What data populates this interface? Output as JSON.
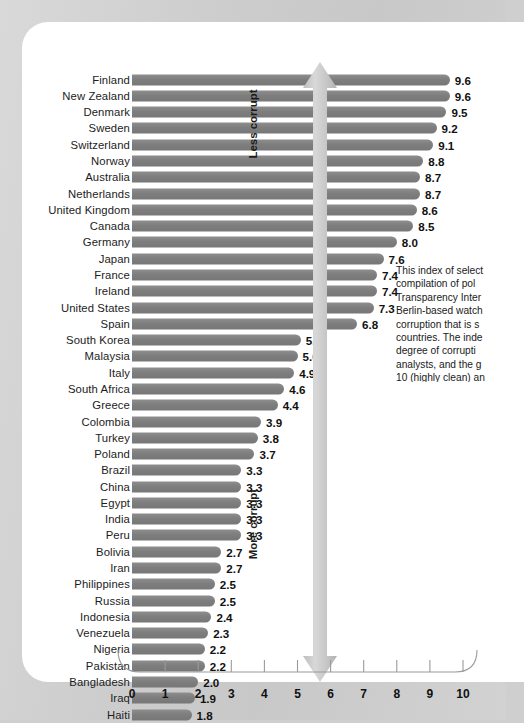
{
  "chart_data": {
    "type": "bar",
    "orientation": "horizontal",
    "title": "",
    "xlabel": "",
    "ylabel": "",
    "xlim": [
      0,
      10
    ],
    "xticks": [
      "0",
      "1",
      "2",
      "3",
      "4",
      "5",
      "6",
      "7",
      "8",
      "9",
      "10"
    ],
    "grid": false,
    "legend": "none",
    "categories": [
      "Finland",
      "New Zealand",
      "Denmark",
      "Sweden",
      "Switzerland",
      "Norway",
      "Australia",
      "Netherlands",
      "United Kingdom",
      "Canada",
      "Germany",
      "Japan",
      "France",
      "Ireland",
      "United States",
      "Spain",
      "South Korea",
      "Malaysia",
      "Italy",
      "South Africa",
      "Greece",
      "Colombia",
      "Turkey",
      "Poland",
      "Brazil",
      "China",
      "Egypt",
      "India",
      "Peru",
      "Bolivia",
      "Iran",
      "Philippines",
      "Russia",
      "Indonesia",
      "Venezuela",
      "Nigeria",
      "Pakistan",
      "Bangladesh",
      "Iraq",
      "Haiti"
    ],
    "values": [
      9.6,
      9.6,
      9.5,
      9.2,
      9.1,
      8.8,
      8.7,
      8.7,
      8.6,
      8.5,
      8.0,
      7.6,
      7.4,
      7.4,
      7.3,
      6.8,
      5.1,
      5.0,
      4.9,
      4.6,
      4.4,
      3.9,
      3.8,
      3.7,
      3.3,
      3.3,
      3.3,
      3.3,
      3.3,
      2.7,
      2.7,
      2.5,
      2.5,
      2.4,
      2.3,
      2.2,
      2.2,
      2.0,
      1.9,
      1.8
    ],
    "value_labels": [
      "9.6",
      "9.6",
      "9.5",
      "9.2",
      "9.1",
      "8.8",
      "8.7",
      "8.7",
      "8.6",
      "8.5",
      "8.0",
      "7.6",
      "7.4",
      "7.4",
      "7.3",
      "6.8",
      "5.1",
      "5.0",
      "4.9",
      "4.6",
      "4.4",
      "3.9",
      "3.8",
      "3.7",
      "3.3",
      "3.3",
      "3.3",
      "3.3",
      "3.3",
      "2.7",
      "2.7",
      "2.5",
      "2.5",
      "2.4",
      "2.3",
      "2.2",
      "2.2",
      "2.0",
      "1.9",
      "1.8"
    ],
    "annotations": {
      "arrow_top": "Less corrupt",
      "arrow_bottom": "More corrupt"
    },
    "colors": {
      "bar": "#7e7e7e",
      "arrow": "#c4c4c4",
      "card_background": "#ffffff",
      "page_background": "#cfcfcf",
      "text": "#1a1a1a"
    }
  },
  "side_note": {
    "lines": [
      "This index of select",
      "compilation of pol",
      "Transparency Inter",
      "Berlin-based watch",
      "corruption that is s",
      "countries. The inde",
      "degree of corrupti",
      "analysts, and the g",
      "10 (highly clean) an"
    ]
  }
}
